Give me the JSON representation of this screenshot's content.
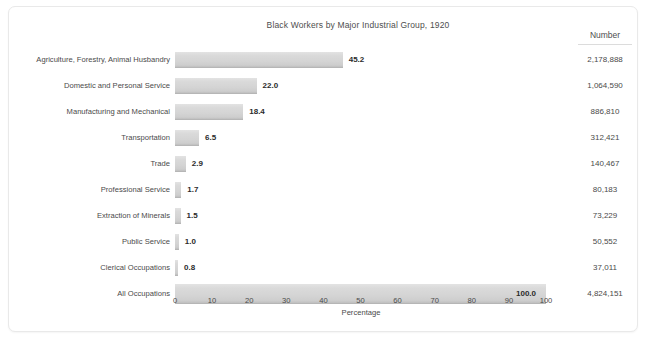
{
  "figure": {
    "title": "Black Workers by Major Industrial Group, 1920",
    "number_column_header": "Number",
    "xlabel": "Percentage"
  },
  "chart_data": {
    "type": "bar",
    "orientation": "horizontal",
    "title": "Black Workers by Major Industrial Group, 1920",
    "xlabel": "Percentage",
    "ylabel": "",
    "xlim": [
      0,
      100
    ],
    "xticks": [
      "0",
      "10",
      "20",
      "30",
      "40",
      "50",
      "60",
      "70",
      "80",
      "90",
      "100"
    ],
    "grid": false,
    "legend": null,
    "extra_column_header": "Number",
    "categories": [
      "Agriculture, Forestry, Animal Husbandry",
      "Domestic and Personal Service",
      "Manufacturing and Mechanical",
      "Transportation",
      "Trade",
      "Professional Service",
      "Extraction of Minerals",
      "Public Service",
      "Clerical Occupations",
      "All Occupations"
    ],
    "values": [
      45.2,
      22.0,
      18.4,
      6.5,
      2.9,
      1.7,
      1.5,
      1.0,
      0.8,
      100.0
    ],
    "value_labels": [
      "45.2",
      "22.0",
      "18.4",
      "6.5",
      "2.9",
      "1.7",
      "1.5",
      "1.0",
      "0.8",
      "100.0"
    ],
    "numbers": [
      "2,178,888",
      "1,064,590",
      "886,810",
      "312,421",
      "140,467",
      "80,183",
      "73,229",
      "50,552",
      "37,011",
      "4,824,151"
    ],
    "colors": {
      "bar_fill": "#d6d6d6",
      "bar_edge": "#b6b6b6",
      "text": "#4a4a4a",
      "value_text": "#2b2b2b",
      "frame": "#e9e9e9",
      "background": "#ffffff"
    }
  },
  "rows": [
    {
      "label": "Agriculture, Forestry, Animal Husbandry",
      "value": 45.2,
      "value_label": "45.2",
      "number": "2,178,888"
    },
    {
      "label": "Domestic and Personal Service",
      "value": 22.0,
      "value_label": "22.0",
      "number": "1,064,590"
    },
    {
      "label": "Manufacturing and Mechanical",
      "value": 18.4,
      "value_label": "18.4",
      "number": "886,810"
    },
    {
      "label": "Transportation",
      "value": 6.5,
      "value_label": "6.5",
      "number": "312,421"
    },
    {
      "label": "Trade",
      "value": 2.9,
      "value_label": "2.9",
      "number": "140,467"
    },
    {
      "label": "Professional Service",
      "value": 1.7,
      "value_label": "1.7",
      "number": "80,183"
    },
    {
      "label": "Extraction of Minerals",
      "value": 1.5,
      "value_label": "1.5",
      "number": "73,229"
    },
    {
      "label": "Public Service",
      "value": 1.0,
      "value_label": "1.0",
      "number": "50,552"
    },
    {
      "label": "Clerical Occupations",
      "value": 0.8,
      "value_label": "0.8",
      "number": "37,011"
    },
    {
      "label": "All Occupations",
      "value": 100.0,
      "value_label": "100.0",
      "number": "4,824,151"
    }
  ],
  "xticks": [
    "0",
    "10",
    "20",
    "30",
    "40",
    "50",
    "60",
    "70",
    "80",
    "90",
    "100"
  ]
}
